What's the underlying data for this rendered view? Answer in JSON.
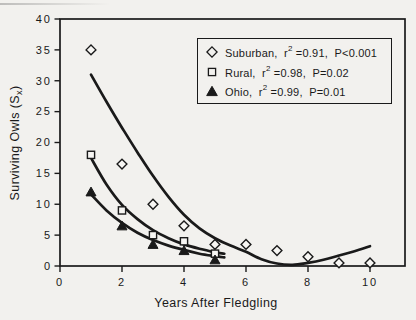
{
  "figure": {
    "background": "#f2f1ee",
    "ink": "#1a1a1a",
    "marker_fill": "#f7f6f3"
  },
  "x_axis_label": "Years After Fledgling",
  "y_axis_label": {
    "prefix": "Surviving Owls (S",
    "sub": "x",
    "suffix": ")"
  },
  "legend": {
    "items": [
      {
        "marker_icon": "open-diamond-icon",
        "prefix": "Suburban,  r",
        "sup": "2",
        "suffix": " =0.91,  P<0.001"
      },
      {
        "marker_icon": "open-square-icon",
        "prefix": "Rural,  r",
        "sup": "2",
        "suffix": " =0.98,  P=0.02"
      },
      {
        "marker_icon": "filled-triangle-icon",
        "prefix": "Ohio,  r",
        "sup": "2",
        "suffix": " =0.99,  P=0.01"
      }
    ]
  },
  "chart_data": {
    "type": "scatter",
    "title": "",
    "xlabel": "Years After Fledgling",
    "ylabel": "Surviving Owls (Sx)",
    "xlim": [
      0,
      11.1
    ],
    "ylim": [
      0,
      40
    ],
    "x_ticks": [
      0,
      2,
      4,
      6,
      8,
      10
    ],
    "y_ticks": [
      0,
      5,
      10,
      15,
      20,
      25,
      30,
      35,
      40
    ],
    "grid": false,
    "legend_position": "top-right",
    "series": [
      {
        "name": "Suburban",
        "marker": "open-diamond",
        "r_squared": 0.91,
        "p_value": "<0.001",
        "points": [
          [
            1,
            35
          ],
          [
            2,
            16.5
          ],
          [
            3,
            10
          ],
          [
            4,
            6.5
          ],
          [
            5,
            3.5
          ],
          [
            6,
            3.5
          ],
          [
            7,
            2.5
          ],
          [
            8,
            1.5
          ],
          [
            9,
            0.5
          ],
          [
            10,
            0.5
          ]
        ],
        "fit_curve": [
          [
            1,
            31
          ],
          [
            1.5,
            26.6
          ],
          [
            2,
            22.4
          ],
          [
            2.5,
            18.4
          ],
          [
            3,
            14.6
          ],
          [
            3.5,
            11.2
          ],
          [
            4,
            8.3
          ],
          [
            4.5,
            6.1
          ],
          [
            5,
            4.5
          ],
          [
            5.5,
            3.3
          ],
          [
            6,
            2.3
          ],
          [
            6.5,
            1.1
          ],
          [
            7,
            0.4
          ],
          [
            7.5,
            0.2
          ],
          [
            8,
            0.5
          ],
          [
            8.5,
            1.0
          ],
          [
            9,
            1.7
          ],
          [
            9.5,
            2.4
          ],
          [
            10,
            3.2
          ]
        ]
      },
      {
        "name": "Rural",
        "marker": "open-square",
        "r_squared": 0.98,
        "p_value": "=0.02",
        "points": [
          [
            1,
            18
          ],
          [
            2,
            9
          ],
          [
            3,
            5
          ],
          [
            4,
            4
          ],
          [
            5,
            2
          ]
        ],
        "fit_curve": [
          [
            1,
            17.5
          ],
          [
            1.5,
            13.2
          ],
          [
            2,
            9.9
          ],
          [
            2.5,
            7.6
          ],
          [
            3,
            5.8
          ],
          [
            3.5,
            4.5
          ],
          [
            4,
            3.5
          ],
          [
            4.5,
            2.8
          ],
          [
            5,
            2.2
          ],
          [
            5.3,
            2.0
          ]
        ]
      },
      {
        "name": "Ohio",
        "marker": "filled-triangle",
        "r_squared": 0.99,
        "p_value": "=0.01",
        "points": [
          [
            1,
            12
          ],
          [
            2,
            6.5
          ],
          [
            3,
            3.5
          ],
          [
            4,
            2.5
          ],
          [
            5,
            1
          ]
        ],
        "fit_curve": [
          [
            1,
            11.6
          ],
          [
            1.5,
            9.0
          ],
          [
            2,
            7.0
          ],
          [
            2.5,
            5.4
          ],
          [
            3,
            4.2
          ],
          [
            3.5,
            3.3
          ],
          [
            4,
            2.6
          ],
          [
            4.5,
            2.0
          ],
          [
            5,
            1.6
          ],
          [
            5.3,
            1.4
          ]
        ]
      }
    ]
  }
}
